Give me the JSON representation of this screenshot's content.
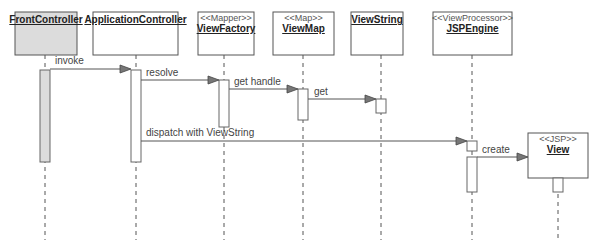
{
  "diagram": {
    "type": "sequence",
    "participants": [
      {
        "id": "front",
        "name": "FrontController",
        "stereotype": "",
        "fill": "#dcdcdc"
      },
      {
        "id": "app",
        "name": "ApplicationController",
        "stereotype": "",
        "fill": "#ffffff"
      },
      {
        "id": "factory",
        "name": "ViewFactory",
        "stereotype": "<<Mapper>>",
        "fill": "#ffffff"
      },
      {
        "id": "map",
        "name": "ViewMap",
        "stereotype": "<<Map>>",
        "fill": "#ffffff"
      },
      {
        "id": "string",
        "name": "ViewString",
        "stereotype": "",
        "fill": "#ffffff"
      },
      {
        "id": "engine",
        "name": "JSPEngine",
        "stereotype": "<<ViewProcessor>>",
        "fill": "#ffffff"
      },
      {
        "id": "view",
        "name": "View",
        "stereotype": "<<JSP>>",
        "fill": "#ffffff"
      }
    ],
    "messages": [
      {
        "from": "FrontController",
        "to": "ApplicationController",
        "label": "invoke"
      },
      {
        "from": "ApplicationController",
        "to": "ViewFactory",
        "label": "resolve"
      },
      {
        "from": "ViewFactory",
        "to": "ViewMap",
        "label": "get handle"
      },
      {
        "from": "ViewMap",
        "to": "ViewString",
        "label": "get"
      },
      {
        "from": "ApplicationController",
        "to": "JSPEngine",
        "label": "dispatch with ViewString"
      },
      {
        "from": "JSPEngine",
        "to": "View",
        "label": "create"
      }
    ]
  }
}
